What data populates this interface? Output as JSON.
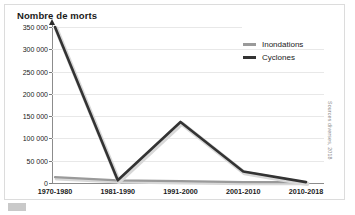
{
  "figure": {
    "title": "Nombre de morts",
    "source_note": "Sources diverses, 2018"
  },
  "legend": {
    "position": "top-right",
    "items": [
      {
        "label": "Inondations",
        "color": "#9a9a9a"
      },
      {
        "label": "Cyclones",
        "color": "#333333"
      }
    ]
  },
  "axes": {
    "y_ticks": [
      "0",
      "50 000",
      "100 000",
      "150 000",
      "200 000",
      "250 000",
      "300 000",
      "350 000"
    ],
    "x_ticks": [
      "1970-1980",
      "1981-1990",
      "1991-2000",
      "2001-2010",
      "2010-2018"
    ]
  },
  "chart_data": {
    "type": "line",
    "title": "Nombre de morts",
    "xlabel": "",
    "ylabel": "Nombre de morts",
    "categories": [
      "1970-1980",
      "1981-1990",
      "1991-2000",
      "2001-2010",
      "2010-2018"
    ],
    "series": [
      {
        "name": "Inondations",
        "color": "#9a9a9a",
        "values": [
          13000,
          6000,
          4000,
          2000,
          2000
        ]
      },
      {
        "name": "Cyclones",
        "color": "#333333",
        "values": [
          350000,
          6000,
          137000,
          26000,
          2000
        ]
      }
    ],
    "ylim": [
      0,
      350000
    ],
    "ytick_step": 50000,
    "grid": true,
    "legend_position": "top-right"
  }
}
